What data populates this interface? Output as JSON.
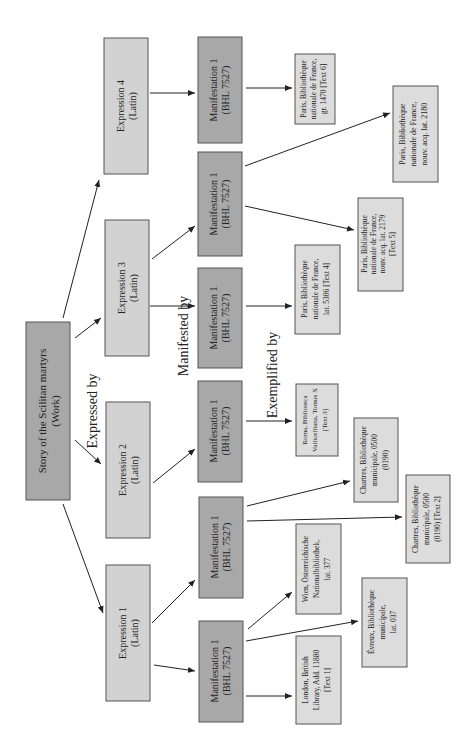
{
  "diagram": {
    "orientation": "rotated -90deg (read bottom-to-top)",
    "relations": {
      "expressed_by": "Expressed by",
      "manifested_by": "Manifested by",
      "exemplified_by": "Exemplified by"
    },
    "work": {
      "line1": "Story of the Scilitan martyrs",
      "line2": "(Work)"
    },
    "expressions": [
      {
        "id": "e1",
        "line1": "Expression 1",
        "line2": "(Latin)"
      },
      {
        "id": "e2",
        "line1": "Expression 2",
        "line2": "(Latin)"
      },
      {
        "id": "e3",
        "line1": "Expression 3",
        "line2": "(Latin)"
      },
      {
        "id": "e4",
        "line1": "Expression 4",
        "line2": "(Latin)"
      }
    ],
    "manifestations": [
      {
        "id": "m1a",
        "expression": "e1",
        "line1": "Manifestation 1",
        "line2": "(BHL 7527)"
      },
      {
        "id": "m1b",
        "expression": "e1",
        "line1": "Manifestation 1",
        "line2": "(BHL 7527)"
      },
      {
        "id": "m2",
        "expression": "e2",
        "line1": "Manifestation 1",
        "line2": "(BHL 7527)"
      },
      {
        "id": "m3a",
        "expression": "e3",
        "line1": "Manifestation 1",
        "line2": "(BHL 7527)"
      },
      {
        "id": "m3b",
        "expression": "e3",
        "line1": "Manifestation 1",
        "line2": "(BHL 7527)"
      },
      {
        "id": "m4",
        "expression": "e4",
        "line1": "Manifestation 1",
        "line2": "(BHL 7527)"
      }
    ],
    "items": [
      {
        "id": "london",
        "manifestation": "m1a",
        "lines": [
          "London, British",
          "Library, Add. 11880",
          "[Text 1]"
        ]
      },
      {
        "id": "evreux",
        "manifestation": "m1a",
        "lines": [
          "Évreux, Bibliothèque",
          "municipale,",
          "lat. 037"
        ]
      },
      {
        "id": "wien",
        "manifestation": "m1a",
        "lines": [
          "Wien, Österreichische",
          "Nationalbibliothek,",
          "lat. 377"
        ]
      },
      {
        "id": "chartres2",
        "manifestation": "m1b",
        "lines": [
          "Chartres, Bibliothèque",
          "municipale, 0500",
          "(0190) [Text 2]"
        ]
      },
      {
        "id": "chartres",
        "manifestation": "m1b",
        "lines": [
          "Chartres, Bibliothèque",
          "municipale, 0500",
          "(0190)"
        ]
      },
      {
        "id": "roma",
        "manifestation": "m2",
        "lines": [
          "Roma, Biblioteca",
          "Vallicelliana, Tomus X",
          "[Text 3]"
        ]
      },
      {
        "id": "paris5306",
        "manifestation": "m3a",
        "lines": [
          "Paris, Bibliothèque",
          "nationale de France,",
          "lat. 5306 [Text 4]"
        ]
      },
      {
        "id": "paris2179",
        "manifestation": "m3b",
        "lines": [
          "Paris, Bibliothèque",
          "nationale de France,",
          "nouv. acq. lat. 2179",
          "[Text 5]"
        ]
      },
      {
        "id": "paris2180",
        "manifestation": "m3b",
        "lines": [
          "Paris, Bibliothèque",
          "nationale de France,",
          "nouv. acq. lat. 2180"
        ]
      },
      {
        "id": "paris1470",
        "manifestation": "m4",
        "lines": [
          "Paris, Bibliothèque",
          "nationale de France,",
          "gr. 1470 [Text 6]"
        ]
      }
    ],
    "colors": {
      "work_fill": "#a8a8a8",
      "expression_fill": "#d2d2d2",
      "manifestation_fill": "#a8a8a8",
      "item_fill": "#dcdcdc",
      "stroke": "#555555"
    }
  }
}
